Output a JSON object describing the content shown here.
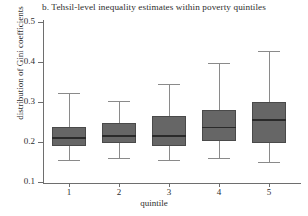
{
  "chart_data": {
    "type": "box",
    "title": "b. Tehsil-level inequality estimates within poverty quintiles",
    "xlabel": "quintile",
    "ylabel": "distribution of Gini coefficients",
    "categories": [
      "1",
      "2",
      "3",
      "4",
      "5"
    ],
    "ylim": [
      0.1,
      0.5
    ],
    "yticks": [
      0.1,
      0.2,
      0.3,
      0.4,
      0.5
    ],
    "ytick_labels": [
      "0.1",
      "0.2",
      "0.3",
      "0.4",
      "0.5"
    ],
    "grid": false,
    "legend": "none",
    "boxes": [
      {
        "category": "1",
        "whisker_low": 0.155,
        "q1": 0.19,
        "median": 0.212,
        "q3": 0.238,
        "whisker_high": 0.322
      },
      {
        "category": "2",
        "whisker_low": 0.16,
        "q1": 0.197,
        "median": 0.217,
        "q3": 0.248,
        "whisker_high": 0.302
      },
      {
        "category": "3",
        "whisker_low": 0.155,
        "q1": 0.19,
        "median": 0.217,
        "q3": 0.265,
        "whisker_high": 0.345
      },
      {
        "category": "4",
        "whisker_low": 0.16,
        "q1": 0.202,
        "median": 0.238,
        "q3": 0.28,
        "whisker_high": 0.397
      },
      {
        "category": "5",
        "whisker_low": 0.15,
        "q1": 0.197,
        "median": 0.257,
        "q3": 0.3,
        "whisker_high": 0.428
      }
    ],
    "colors": {
      "box_fill": "#666666",
      "box_edge": "#4a4a4a",
      "median": "#2a2a2a",
      "whisker": "#8a8a8a",
      "axis": "#6e6e6e",
      "background": "#ffffff",
      "text": "#2e2e2e"
    }
  }
}
